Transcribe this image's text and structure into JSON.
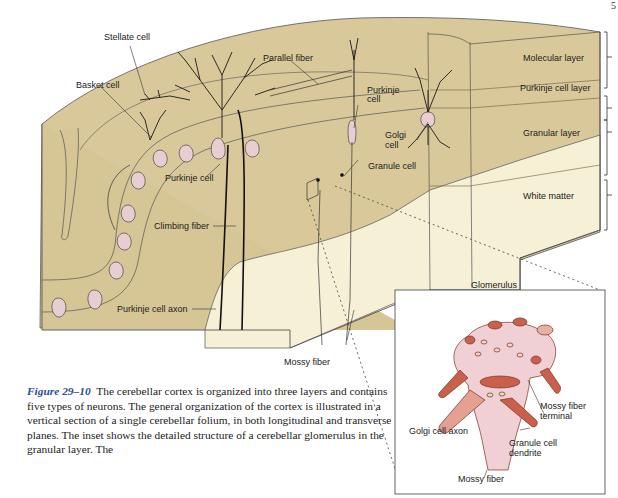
{
  "page": {
    "page_number_fragment": "5"
  },
  "figure": {
    "labels": {
      "stellate_cell": "Stellate cell",
      "basket_cell": "Basket cell",
      "parallel_fiber": "Parallel fiber",
      "purkinje_cell_upper": "Purkinje\ncell",
      "purkinje_cell_upper_l1": "Purkinje",
      "purkinje_cell_upper_l2": "cell",
      "golgi_cell_l1": "Golgi",
      "golgi_cell_l2": "cell",
      "granule_cell": "Granule cell",
      "purkinje_cell": "Purkinje cell",
      "climbing_fiber": "Climbing fiber",
      "purkinje_cell_axon": "Purkinje cell axon",
      "mossy_fiber": "Mossy fiber"
    },
    "layers": [
      {
        "name": "Molecular layer"
      },
      {
        "name": "Purkinje cell layer"
      },
      {
        "name": "Granular layer"
      },
      {
        "name": "White matter"
      }
    ],
    "inset": {
      "title": "Glomerulus",
      "labels": {
        "mossy_fiber_terminal_l1": "Mossy fiber",
        "mossy_fiber_terminal_l2": "terminal",
        "golgi_cell_axon": "Golgi cell axon",
        "granule_cell_dendrite_l1": "Granule cell",
        "granule_cell_dendrite_l2": "dendrite",
        "mossy_fiber": "Mossy fiber"
      }
    },
    "colors": {
      "gray_matter": "#d9c99a",
      "white_matter": "#f6f0d6",
      "cell_body": "#e8cdd3",
      "glomerulus_pink": "#f0d0d4",
      "glomerulus_red": "#c8604c",
      "caption_accent": "#2a4d9a"
    }
  },
  "caption": {
    "figure_number": "Figure 29–10",
    "text": "The cerebellar cortex is organized into three layers and contains five types of neurons. The general organization of the cortex is illustrated in a vertical section of a single cerebellar folium, in both longitudinal and transverse planes. The inset shows the detailed structure of a cerebellar glomerulus in the granular layer. The"
  }
}
